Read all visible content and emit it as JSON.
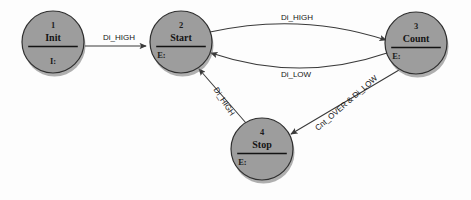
{
  "diagram": {
    "background_color": "#fdfdfd",
    "node_fill_color": "#9d9d9d",
    "node_border_color": "#2f2f2f",
    "edge_color": "#3a3a3a",
    "text_color": "#141414",
    "states": [
      {
        "id": "init",
        "number": "1",
        "name": "Init",
        "action": "I:",
        "cx": 53,
        "cy": 42,
        "r": 31,
        "action_align": "center"
      },
      {
        "id": "start",
        "number": "2",
        "name": "Start",
        "action": "E:",
        "cx": 181,
        "cy": 42,
        "r": 31,
        "action_align": "left"
      },
      {
        "id": "count",
        "number": "3",
        "name": "Count",
        "action": "E:",
        "cx": 416,
        "cy": 43,
        "r": 31,
        "action_align": "left"
      },
      {
        "id": "stop",
        "number": "4",
        "name": "Stop",
        "action": "E:",
        "cx": 262,
        "cy": 149,
        "r": 31,
        "action_align": "left"
      }
    ],
    "transitions": [
      {
        "id": "init-to-start",
        "from": "init",
        "to": "start",
        "label": "Di_HIGH",
        "label_x": 119,
        "label_y": 40,
        "label_rotation": 0,
        "path": "M 85 46 L 146 46"
      },
      {
        "id": "start-to-count",
        "from": "start",
        "to": "count",
        "label": "Di_HIGH",
        "label_x": 297,
        "label_y": 20,
        "label_rotation": 0,
        "path": "M 210 32 Q 300 12 386 40"
      },
      {
        "id": "count-to-start",
        "from": "count",
        "to": "start",
        "label": "Di_LOW",
        "label_x": 296,
        "label_y": 77,
        "label_rotation": 0,
        "path": "M 387 53 Q 300 83 211 53"
      },
      {
        "id": "count-to-stop",
        "from": "count",
        "to": "stop",
        "label": "Cnt_OVER & Di_LOW",
        "label_x": 348,
        "label_y": 105,
        "label_rotation": -41,
        "path": "M 399 70 L 291 134"
      },
      {
        "id": "stop-to-start",
        "from": "stop",
        "to": "start",
        "label": "Di_HIGH",
        "label_x": 222,
        "label_y": 103,
        "label_rotation": 57,
        "path": "M 246 123 L 199 69"
      }
    ]
  }
}
